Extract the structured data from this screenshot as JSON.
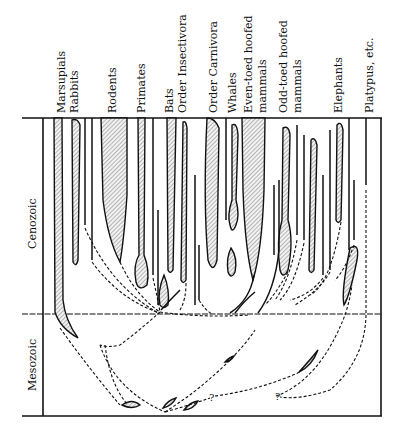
{
  "diagram": {
    "eras": [
      {
        "label": "Cenozoic"
      },
      {
        "label": "Mesozoic"
      }
    ],
    "taxa": [
      {
        "label": "Marsupials"
      },
      {
        "label": "Rabbits"
      },
      {
        "label": "Rodents"
      },
      {
        "label": "Primates"
      },
      {
        "label": "Bats"
      },
      {
        "label": "Order Insectivora"
      },
      {
        "label": "Order Carnivora"
      },
      {
        "label": "Whales"
      },
      {
        "label": "Even-toed hoofed",
        "line2": "mammals"
      },
      {
        "label": "Odd-toed hoofed",
        "line2": "mammals"
      },
      {
        "label": "Elephants"
      },
      {
        "label": "Platypus, etc."
      }
    ],
    "uncertain_marks": [
      "?",
      "?"
    ],
    "colors": {
      "ink": "#111111",
      "hatch": "#8a8a8a",
      "paper": "#ffffff"
    }
  }
}
